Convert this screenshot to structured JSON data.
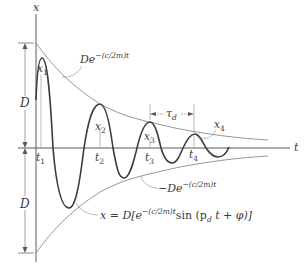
{
  "diagram": {
    "type": "damped-oscillation",
    "axes": {
      "vertical_label": "x",
      "horizontal_label": "t"
    },
    "amplitude_labels": {
      "upper": "D",
      "lower": "D"
    },
    "envelopes": {
      "upper": {
        "prefix": "De",
        "exponent": "−(c/2m)t"
      },
      "lower": {
        "prefix": "−De",
        "exponent": "−(c/2m)t"
      }
    },
    "peaks": [
      {
        "label": "x",
        "sub": "1"
      },
      {
        "label": "x",
        "sub": "2"
      },
      {
        "label": "x",
        "sub": "3"
      },
      {
        "label": "x",
        "sub": "4"
      }
    ],
    "times": [
      {
        "label": "t",
        "sub": "1"
      },
      {
        "label": "t",
        "sub": "2"
      },
      {
        "label": "t",
        "sub": "3"
      },
      {
        "label": "t",
        "sub": "4"
      }
    ],
    "period": {
      "label": "τ",
      "sub": "d"
    },
    "equation": {
      "lhs": "x = D[e",
      "exponent": "−(c/2m)t",
      "rhs_sin": "sin (p",
      "rhs_sub": "d",
      "rhs_tail": " t + φ)]"
    },
    "colors": {
      "curve": "#3d3d3d",
      "envelope": "#8a8a8a",
      "axis": "#5a5a5a",
      "text": "#3a3a3a"
    }
  }
}
